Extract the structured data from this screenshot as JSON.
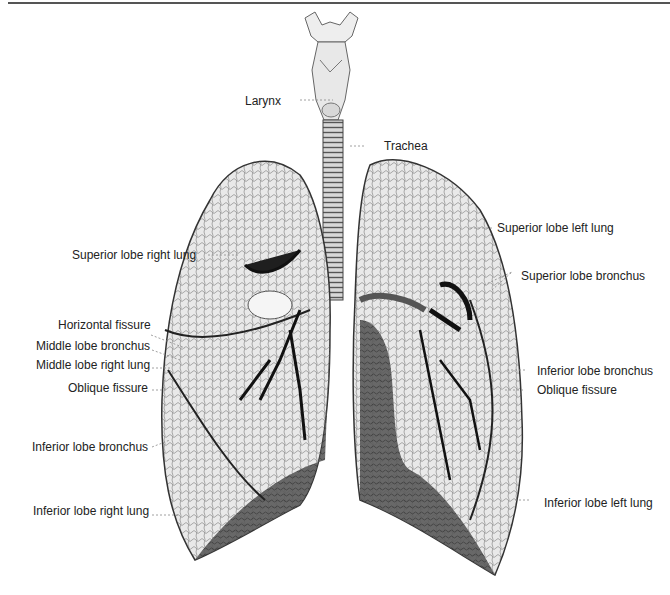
{
  "figure": {
    "colors": {
      "ink": "#222222",
      "lung_fill": "#e6e6e6",
      "lung_shade": "#6a6a6a",
      "bronchus": "#1a1a1a",
      "leader": "#888888",
      "rule": "#555555"
    }
  },
  "labels": {
    "larynx": "Larynx",
    "trachea": "Trachea",
    "superior_lobe_right_lung": "Superior lobe right lung",
    "superior_lobe_left_lung": "Superior lobe left lung",
    "superior_lobe_bronchus": "Superior lobe bronchus",
    "horizontal_fissure": "Horizontal fissure",
    "middle_lobe_bronchus": "Middle lobe bronchus",
    "middle_lobe_right_lung": "Middle lobe right lung",
    "oblique_fissure_right": "Oblique fissure",
    "inferior_lobe_bronchus_left_side": "Inferior lobe bronchus",
    "inferior_lobe_bronchus_right_side": "Inferior lobe bronchus",
    "oblique_fissure_left": "Oblique fissure",
    "inferior_lobe_right_lung": "Inferior lobe right lung",
    "inferior_lobe_left_lung": "Inferior lobe left lung"
  }
}
